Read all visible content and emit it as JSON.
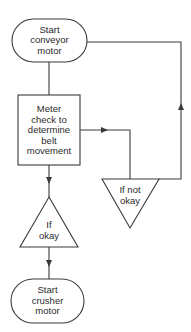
{
  "diagram": {
    "type": "flowchart",
    "stroke_color": "#3a3a3a",
    "text_color": "#2a2a2a",
    "background": "#ffffff",
    "nodes": {
      "start_conveyor": {
        "shape": "terminator",
        "label": "Start\nconveyor\nmotor"
      },
      "meter_check": {
        "shape": "process",
        "label": "Meter\ncheck to\ndetermine\nbelt\nmovement"
      },
      "if_okay": {
        "shape": "triangle-up",
        "label": "If\nokay"
      },
      "if_not_okay": {
        "shape": "triangle-down",
        "label": "If not\nokay"
      },
      "start_crusher": {
        "shape": "terminator",
        "label": "Start\ncrusher\nmotor"
      }
    },
    "edges": [
      {
        "from": "start_conveyor",
        "to": "meter_check"
      },
      {
        "from": "meter_check",
        "to": "if_not_okay"
      },
      {
        "from": "if_not_okay",
        "to": "start_conveyor"
      },
      {
        "from": "meter_check",
        "to": "if_okay"
      },
      {
        "from": "if_okay",
        "to": "start_crusher"
      }
    ]
  }
}
